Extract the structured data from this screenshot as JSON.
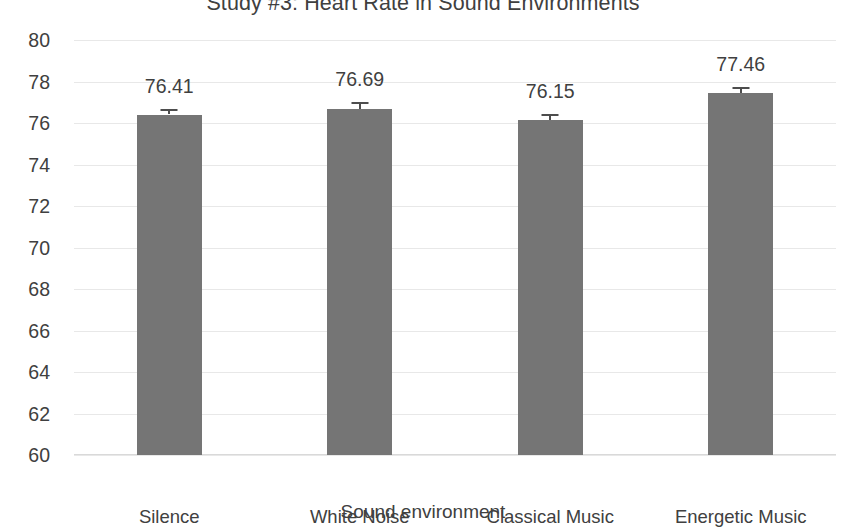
{
  "chart_data": {
    "type": "bar",
    "title": "Study #3: Heart Rate in Sound Environments",
    "xlabel": "Sound environment",
    "ylabel": "Heart rate",
    "categories": [
      "Silence",
      "White Noise",
      "Classical Music",
      "Energetic Music"
    ],
    "values": [
      76.41,
      76.69,
      76.15,
      77.46
    ],
    "value_labels": [
      "76.41",
      "76.69",
      "76.15",
      "77.46"
    ],
    "error_upper": [
      0.28,
      0.3,
      0.27,
      0.26
    ],
    "ylim": [
      60,
      80
    ],
    "ytick_step": 2,
    "ytick_labels": [
      "80",
      "78",
      "76",
      "74",
      "72",
      "70",
      "68",
      "66",
      "64",
      "62",
      "60"
    ],
    "grid": true,
    "legend": "none",
    "bar_color": "#757575",
    "error_bar_color": "#4d4d4d",
    "gridline_color": "#e8e8e8",
    "text_color": "#404040",
    "background_color": "#ffffff"
  }
}
